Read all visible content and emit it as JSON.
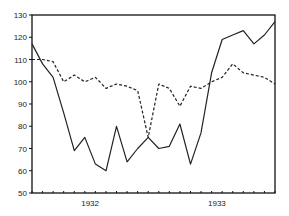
{
  "chart_data": {
    "type": "line",
    "title": "",
    "xlabel": "",
    "ylabel": "",
    "ylim": [
      50,
      130
    ],
    "yticks": [
      50,
      60,
      70,
      80,
      90,
      100,
      110,
      120,
      130
    ],
    "xtick_labels": [
      {
        "label": "1932",
        "index": 5.5
      },
      {
        "label": "1933",
        "index": 17.5
      }
    ],
    "x_count": 24,
    "grid": false,
    "legend": null,
    "series": [
      {
        "name": "solid",
        "style": "solid",
        "values": [
          117,
          108,
          102,
          86,
          69,
          75,
          63,
          60,
          80,
          64,
          70,
          75,
          70,
          71,
          81,
          63,
          77,
          104,
          119,
          121,
          123,
          117,
          121,
          127
        ]
      },
      {
        "name": "dashed",
        "style": "dashed",
        "values": [
          110,
          110,
          109,
          100,
          103,
          100,
          102,
          97,
          99,
          98,
          96,
          75,
          99,
          97,
          89,
          98,
          97,
          100,
          102,
          108,
          104,
          103,
          102,
          99
        ]
      }
    ]
  }
}
